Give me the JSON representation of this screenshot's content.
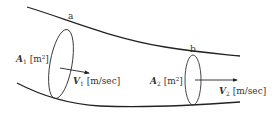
{
  "diagram": {
    "type": "pipe-flow",
    "colors": {
      "stroke": "#222222",
      "text": "#333333",
      "background": "#ffffff"
    },
    "section_a": {
      "label": "a",
      "area_symbol": "A",
      "area_sub": "1",
      "area_unit_open": " [m",
      "area_unit_sup": "2",
      "area_unit_close": "]",
      "velocity_symbol": "V",
      "velocity_sub": "1",
      "velocity_unit": " [m/sec]"
    },
    "section_b": {
      "label": "b",
      "area_symbol": "A",
      "area_sub": "2",
      "area_unit_open": " [m",
      "area_unit_sup": "2",
      "area_unit_close": "]",
      "velocity_symbol": "V",
      "velocity_sub": "2",
      "velocity_unit": " [m/sec]"
    }
  }
}
